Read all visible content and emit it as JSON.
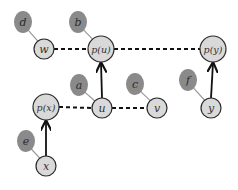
{
  "diagram": {
    "nodes": [
      {
        "id": "w",
        "label": "w",
        "cx": 44,
        "cy": 49,
        "r": 10
      },
      {
        "id": "pu",
        "label": "p(u)",
        "cx": 101,
        "cy": 49,
        "r": 13
      },
      {
        "id": "py",
        "label": "p(y)",
        "cx": 213,
        "cy": 49,
        "r": 13
      },
      {
        "id": "px",
        "label": "p(x)",
        "cx": 46,
        "cy": 107,
        "r": 13
      },
      {
        "id": "u",
        "label": "u",
        "cx": 102,
        "cy": 108,
        "r": 10
      },
      {
        "id": "v",
        "label": "v",
        "cx": 157,
        "cy": 108,
        "r": 10
      },
      {
        "id": "y",
        "label": "y",
        "cx": 211,
        "cy": 108,
        "r": 10
      },
      {
        "id": "x",
        "label": "x",
        "cx": 46,
        "cy": 166,
        "r": 10
      }
    ],
    "blobs": [
      {
        "id": "d",
        "label": "d",
        "cx": 23,
        "cy": 22,
        "attached_to": "w"
      },
      {
        "id": "b",
        "label": "b",
        "cx": 78,
        "cy": 22,
        "attached_to": "pu"
      },
      {
        "id": "a",
        "label": "a",
        "cx": 79,
        "cy": 85,
        "attached_to": "u"
      },
      {
        "id": "c",
        "label": "c",
        "cx": 135,
        "cy": 84,
        "attached_to": "v"
      },
      {
        "id": "f",
        "label": "f",
        "cx": 188,
        "cy": 80,
        "attached_to": "y"
      },
      {
        "id": "e",
        "label": "e",
        "cx": 26,
        "cy": 141,
        "attached_to": "x"
      }
    ],
    "dashed_edges": [
      {
        "from": "w",
        "to": "pu"
      },
      {
        "from": "pu",
        "to": "py"
      },
      {
        "from": "px",
        "to": "u"
      },
      {
        "from": "u",
        "to": "v"
      }
    ],
    "arrow_edges": [
      {
        "from": "u",
        "to": "pu"
      },
      {
        "from": "y",
        "to": "py"
      },
      {
        "from": "x",
        "to": "px"
      }
    ],
    "colors": {
      "node_fill": "#d9d9d9",
      "node_stroke": "#2a2a2a",
      "blob_fill": "#8a8a8a",
      "edge": "#111111",
      "tether": "#9a9a9a"
    }
  }
}
